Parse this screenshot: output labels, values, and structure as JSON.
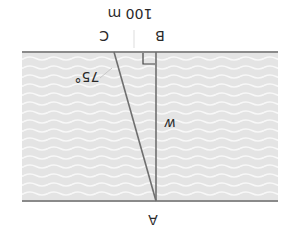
{
  "diagram": {
    "rotation_deg": 180,
    "labels": {
      "point_a": "A",
      "point_b": "B",
      "point_c": "C",
      "distance_bc": "100 m",
      "angle_c": "75°",
      "width": "w"
    },
    "colors": {
      "water": "#e6e6e6",
      "wave": "#f7f7f7",
      "bank_line": "#8a8a8a",
      "segment_line": "#6f6f6f",
      "text": "#2a2a2a"
    }
  }
}
